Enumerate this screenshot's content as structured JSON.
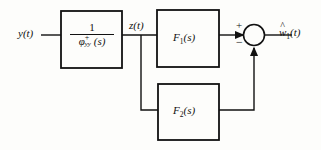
{
  "figure": {
    "type": "block-diagram",
    "title": "",
    "background_color": "#fdfdfb",
    "line_color": "#111111"
  },
  "signals": {
    "input_label": "y(t)",
    "intermediate_label": "z(t)",
    "output_label_w": "w",
    "output_label_sub": "1",
    "output_label_tail": "(t)",
    "output_label_full": "ŵ₁(t)"
  },
  "blocks": [
    {
      "id": "whitening-filter",
      "label_numerator": "1",
      "label_denominator_base": "φ",
      "label_denominator_sup": "+",
      "label_denominator_sub": "yy",
      "label_denominator_tail": "(s)",
      "label_full": "1 / φ⁺yy (s)"
    },
    {
      "id": "f1",
      "label_base": "F",
      "label_sub": "1",
      "label_tail": "(s)",
      "label_full": "F₁(s)"
    },
    {
      "id": "f2",
      "label_base": "F",
      "label_sub": "2",
      "label_tail": "(s)",
      "label_full": "F₂(s)"
    }
  ],
  "summing_junction": {
    "sign_top": "+",
    "sign_bottom": "−"
  }
}
